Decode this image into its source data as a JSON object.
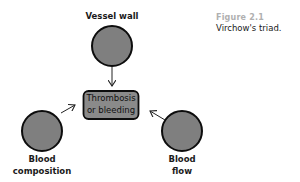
{
  "figure": {
    "number": "Figure 2.1",
    "title": "Virchow's triad."
  },
  "diagram": {
    "center_node": {
      "line1": "Thrombosis",
      "line2": "or bleeding"
    },
    "nodes": [
      {
        "id": "vessel-wall",
        "label_line1": "Vessel wall",
        "label_line2": ""
      },
      {
        "id": "blood-composition",
        "label_line1": "Blood",
        "label_line2": "composition"
      },
      {
        "id": "blood-flow",
        "label_line1": "Blood",
        "label_line2": "flow"
      }
    ],
    "edges": [
      {
        "from": "vessel-wall",
        "to": "center"
      },
      {
        "from": "blood-composition",
        "to": "center"
      },
      {
        "from": "blood-flow",
        "to": "center"
      }
    ],
    "colors": {
      "node_fill": "#7f7f7f",
      "node_stroke": "#0d0d0d",
      "box_fill": "#8a8a8a",
      "arrow": "#222222",
      "caption_number": "#b0b0b0",
      "text": "#1a1a1a"
    }
  }
}
